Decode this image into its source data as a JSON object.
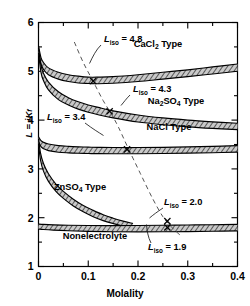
{
  "chart_data": {
    "type": "area",
    "title": "",
    "xlabel": "Molality",
    "ylabel": "L = iK_f",
    "xlim": [
      0,
      0.4
    ],
    "ylim": [
      1,
      6
    ],
    "xticks": [
      0,
      0.1,
      0.2,
      0.3,
      0.4
    ],
    "xticklabels": [
      "0",
      "0.1",
      "0.2",
      "0.3",
      "0.4"
    ],
    "xminorticks": [
      0.05,
      0.15,
      0.25,
      0.35
    ],
    "yticks": [
      1,
      2,
      3,
      4,
      5,
      6
    ],
    "yticklabels": [
      "1",
      "2",
      "3",
      "4",
      "5",
      "6"
    ],
    "yminorticks": [
      1.5,
      2.5,
      3.5,
      4.5,
      5.5
    ],
    "grid": false,
    "legend_position": "inline-annotations",
    "bands": [
      {
        "name": "CaCl2 Type",
        "label": "CaCl₂ Type",
        "x": [
          0.0,
          0.005,
          0.01,
          0.02,
          0.04,
          0.06,
          0.08,
          0.1,
          0.12,
          0.15,
          0.2,
          0.25,
          0.3,
          0.35,
          0.4
        ],
        "upper": [
          5.52,
          5.28,
          5.18,
          5.07,
          4.98,
          4.93,
          4.9,
          4.88,
          4.88,
          4.89,
          4.93,
          4.98,
          5.03,
          5.09,
          5.15
        ],
        "lower": [
          5.43,
          5.15,
          5.04,
          4.93,
          4.84,
          4.79,
          4.76,
          4.75,
          4.745,
          4.755,
          4.79,
          4.84,
          4.89,
          4.945,
          5.0
        ]
      },
      {
        "name": "Na2SO4 Type",
        "label": "Na₂SO₄ Type",
        "x": [
          0.0,
          0.005,
          0.01,
          0.02,
          0.04,
          0.06,
          0.08,
          0.1,
          0.12,
          0.15,
          0.2,
          0.25,
          0.3,
          0.35,
          0.4
        ],
        "upper": [
          5.48,
          5.12,
          4.96,
          4.78,
          4.58,
          4.46,
          4.375,
          4.31,
          4.26,
          4.19,
          4.105,
          4.045,
          4.0,
          3.965,
          3.935
        ],
        "lower": [
          5.38,
          4.98,
          4.81,
          4.62,
          4.42,
          4.31,
          4.225,
          4.16,
          4.11,
          4.045,
          3.96,
          3.905,
          3.862,
          3.83,
          3.805
        ]
      },
      {
        "name": "NaCl Type",
        "label": "NaCl Type",
        "x": [
          0.0,
          0.005,
          0.01,
          0.02,
          0.04,
          0.06,
          0.08,
          0.1,
          0.12,
          0.15,
          0.2,
          0.25,
          0.3,
          0.35,
          0.4
        ],
        "upper": [
          3.66,
          3.58,
          3.545,
          3.51,
          3.478,
          3.462,
          3.452,
          3.446,
          3.442,
          3.438,
          3.438,
          3.442,
          3.45,
          3.462,
          3.478
        ],
        "lower": [
          3.56,
          3.455,
          3.415,
          3.375,
          3.342,
          3.328,
          3.32,
          3.315,
          3.312,
          3.31,
          3.31,
          3.315,
          3.322,
          3.332,
          3.345
        ]
      },
      {
        "name": "ZnSO4 Type",
        "label": "ZnSO₄ Type",
        "x": [
          0.0,
          0.004,
          0.01,
          0.02,
          0.035,
          0.05,
          0.07,
          0.09,
          0.11,
          0.13,
          0.15,
          0.17,
          0.19
        ],
        "upper": [
          3.62,
          3.33,
          3.11,
          2.9,
          2.69,
          2.54,
          2.38,
          2.25,
          2.15,
          2.06,
          1.99,
          1.93,
          1.88
        ],
        "lower": [
          3.52,
          3.185,
          2.955,
          2.745,
          2.54,
          2.395,
          2.24,
          2.12,
          2.02,
          1.94,
          1.88,
          1.83,
          1.8
        ]
      },
      {
        "name": "Nonelectrolyte",
        "label": "Nonelectrolyte",
        "x": [
          0.0,
          0.01,
          0.03,
          0.06,
          0.1,
          0.15,
          0.2,
          0.25,
          0.3,
          0.35,
          0.4
        ],
        "upper": [
          1.87,
          1.862,
          1.853,
          1.845,
          1.84,
          1.838,
          1.84,
          1.845,
          1.85,
          1.855,
          1.862
        ],
        "lower": [
          1.768,
          1.758,
          1.745,
          1.732,
          1.72,
          1.712,
          1.71,
          1.712,
          1.716,
          1.722,
          1.73
        ]
      }
    ],
    "iso_line": {
      "name": "L_iso locus (dashed)",
      "x": [
        0.072,
        0.09,
        0.11,
        0.13,
        0.145,
        0.16,
        0.18,
        0.205,
        0.23,
        0.25,
        0.262,
        0.272,
        0.285
      ],
      "y": [
        5.6,
        5.18,
        4.79,
        4.4,
        4.15,
        3.87,
        3.43,
        2.9,
        2.38,
        2.02,
        1.87,
        1.76,
        1.64
      ]
    },
    "markers": [
      {
        "label": "L_iso = 4.8",
        "x": 0.11,
        "y": 4.8
      },
      {
        "label": "L_iso = 4.3",
        "x": 0.143,
        "y": 4.18
      },
      {
        "label": "L_iso = 3.4",
        "x": 0.178,
        "y": 3.4
      },
      {
        "label": "L_iso = 2.0",
        "x": 0.259,
        "y": 1.93
      },
      {
        "label": "L_iso = 1.9",
        "x": 0.259,
        "y": 1.8
      }
    ],
    "annotations": [
      {
        "name": "iso-4-8",
        "base": "L",
        "sub": "iso",
        "eq": "= 4.8",
        "value": 4.8
      },
      {
        "name": "iso-4-3",
        "base": "L",
        "sub": "iso",
        "eq": "= 4.3",
        "value": 4.3
      },
      {
        "name": "iso-3-4",
        "base": "L",
        "sub": "iso",
        "eq": "= 3.4",
        "value": 3.4
      },
      {
        "name": "iso-2-0",
        "base": "L",
        "sub": "iso",
        "eq": "= 2.0",
        "value": 2.0
      },
      {
        "name": "iso-1-9",
        "base": "L",
        "sub": "iso",
        "eq": "= 1.9",
        "value": 1.9
      }
    ]
  },
  "axes": {
    "xlabel": "Molality",
    "ylabel_main": "L",
    "ylabel_eq": " = i",
    "ylabel_k": "K",
    "ylabel_sub": "f",
    "xticklabels": [
      "0",
      "0.1",
      "0.2",
      "0.3",
      "0.4"
    ],
    "yticklabels": [
      "1",
      "2",
      "3",
      "4",
      "5",
      "6"
    ]
  },
  "band_labels": {
    "cacl2": {
      "pre": "CaCl",
      "sub": "2",
      "post": " Type"
    },
    "na2so4": {
      "a": "Na",
      "s1": "2",
      "b": "SO",
      "s2": "4",
      "post": " Type"
    },
    "nacl": {
      "text": "NaCl Type"
    },
    "znso4": {
      "pre": "ZnSO",
      "sub": "4",
      "post": " Type"
    },
    "nonelectrolyte": {
      "text": "Nonelectrolyte"
    }
  },
  "iso_labels": {
    "l": "L",
    "sub": "iso",
    "v48": "= 4.8",
    "v43": "= 4.3",
    "v34": "= 3.4",
    "v20": "= 2.0",
    "v19": "= 1.9"
  },
  "colors": {
    "axis": "#000000",
    "band_fill": "#b9b9b9",
    "band_edge": "#000000",
    "dashed": "#555555",
    "background": "#ffffff"
  }
}
